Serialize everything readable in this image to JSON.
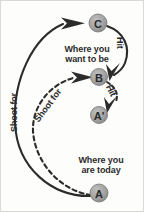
{
  "diagram": {
    "colors": {
      "node_fill": "#9a9a9a",
      "node_stroke": "#6f6f6f",
      "line": "#2b2b2b",
      "background": "#fdfdfc",
      "border": "#d8d8d6",
      "text": "#2a2a2a"
    },
    "nodes": [
      {
        "id": "C",
        "label": "C",
        "cx": 97,
        "cy": 22,
        "r": 9
      },
      {
        "id": "B",
        "label": "B",
        "cx": 98,
        "cy": 76,
        "r": 8.5
      },
      {
        "id": "Ap",
        "label": "A'",
        "cx": 98,
        "cy": 114,
        "r": 8.5
      },
      {
        "id": "A",
        "label": "A",
        "cx": 98,
        "cy": 192,
        "r": 9
      }
    ],
    "captions": {
      "want_to_be": "Where you\nwant to be",
      "want_to_be_line1": "Where you",
      "want_to_be_line2": "want to be",
      "are_today_line1": "Where you",
      "are_today_line2": "are today"
    },
    "edge_labels": {
      "shoot_for_solid": "Shoot for",
      "shoot_for_dashed": "Shoot for",
      "hit_from_c": "Hit",
      "hit_from_b": "Hit"
    },
    "edges": [
      {
        "name": "shoot-for-solid",
        "from": "A",
        "to": "C",
        "style": "solid"
      },
      {
        "name": "hit-c-to-b",
        "from": "C",
        "to": "B",
        "style": "solid"
      },
      {
        "name": "shoot-for-dashed",
        "from": "A",
        "to": "B",
        "style": "dashed"
      },
      {
        "name": "hit-b-to-aprime",
        "from": "B",
        "to": "Ap",
        "style": "dashed"
      }
    ]
  }
}
